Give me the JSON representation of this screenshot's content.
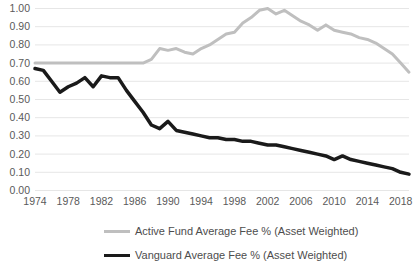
{
  "chart_data": {
    "type": "line",
    "title": "",
    "xlabel": "",
    "ylabel": "",
    "x": [
      1974,
      1975,
      1976,
      1977,
      1978,
      1979,
      1980,
      1981,
      1982,
      1983,
      1984,
      1985,
      1986,
      1987,
      1988,
      1989,
      1990,
      1991,
      1992,
      1993,
      1994,
      1995,
      1996,
      1997,
      1998,
      1999,
      2000,
      2001,
      2002,
      2003,
      2004,
      2005,
      2006,
      2007,
      2008,
      2009,
      2010,
      2011,
      2012,
      2013,
      2014,
      2015,
      2016,
      2017,
      2018,
      2019
    ],
    "xlim": [
      1974,
      2019
    ],
    "ylim": [
      0.0,
      1.0
    ],
    "xticks": [
      1974,
      1978,
      1982,
      1986,
      1990,
      1994,
      1998,
      2002,
      2006,
      2010,
      2014,
      2018
    ],
    "xticklabels": [
      "1974",
      "1978",
      "1982",
      "1986",
      "1990",
      "1994",
      "1998",
      "2002",
      "2006",
      "2010",
      "2014",
      "2018"
    ],
    "yticks": [
      0.0,
      0.1,
      0.2,
      0.3,
      0.4,
      0.5,
      0.6,
      0.7,
      0.8,
      0.9,
      1.0
    ],
    "yticklabels": [
      "0.00",
      "0.10",
      "0.20",
      "0.30",
      "0.40",
      "0.50",
      "0.60",
      "0.70",
      "0.80",
      "0.90",
      "1.00"
    ],
    "grid": true,
    "grid_axis": "y",
    "legend_position": "bottom",
    "series": [
      {
        "name": "Active Fund Average Fee % (Asset Weighted)",
        "color": "#bfbfbf",
        "width": 3.0,
        "values": [
          0.7,
          0.7,
          0.7,
          0.7,
          0.7,
          0.7,
          0.7,
          0.7,
          0.7,
          0.7,
          0.7,
          0.7,
          0.7,
          0.7,
          0.72,
          0.78,
          0.77,
          0.78,
          0.76,
          0.75,
          0.78,
          0.8,
          0.83,
          0.86,
          0.87,
          0.92,
          0.95,
          0.99,
          1.0,
          0.97,
          0.99,
          0.96,
          0.93,
          0.91,
          0.88,
          0.91,
          0.88,
          0.87,
          0.86,
          0.84,
          0.83,
          0.81,
          0.78,
          0.75,
          0.7,
          0.65
        ]
      },
      {
        "name": "Vanguard Average Fee % (Asset Weighted)",
        "color": "#1a1a1a",
        "width": 3.5,
        "values": [
          0.67,
          0.66,
          0.6,
          0.54,
          0.57,
          0.59,
          0.62,
          0.57,
          0.63,
          0.62,
          0.62,
          0.55,
          0.49,
          0.43,
          0.36,
          0.34,
          0.38,
          0.33,
          0.32,
          0.31,
          0.3,
          0.29,
          0.29,
          0.28,
          0.28,
          0.27,
          0.27,
          0.26,
          0.25,
          0.25,
          0.24,
          0.23,
          0.22,
          0.21,
          0.2,
          0.19,
          0.17,
          0.19,
          0.17,
          0.16,
          0.15,
          0.14,
          0.13,
          0.12,
          0.1,
          0.09
        ]
      }
    ]
  },
  "legend": {
    "items": [
      {
        "label": "Active Fund Average Fee % (Asset Weighted)"
      },
      {
        "label": "Vanguard Average Fee % (Asset Weighted)"
      }
    ]
  }
}
